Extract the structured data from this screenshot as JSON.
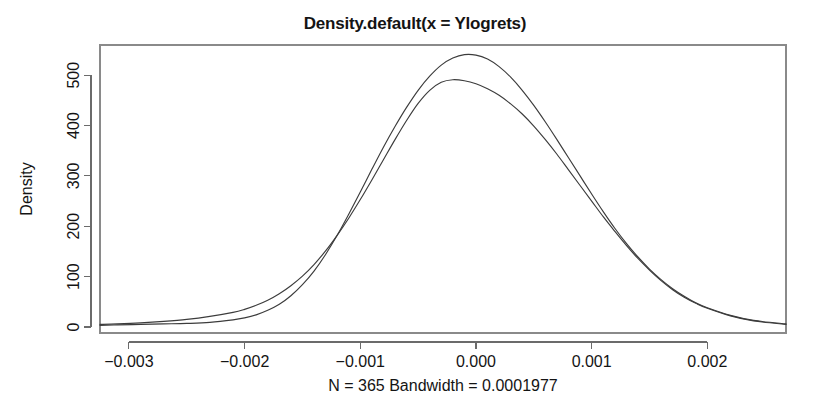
{
  "chart_data": {
    "type": "line",
    "title": "Density.default(x = Ylogrets)",
    "xlabel": "N = 365 Bandwidth = 0.0001977",
    "ylabel": "Density",
    "xlim": [
      -0.00325,
      0.00268
    ],
    "ylim": [
      -12,
      560
    ],
    "grid": false,
    "legend": "none",
    "xticks": [
      "-0.003",
      "-0.002",
      "-0.001",
      "0.000",
      "0.001",
      "0.002"
    ],
    "xtick_values": [
      -0.003,
      -0.002,
      -0.001,
      0.0,
      0.001,
      0.002
    ],
    "yticks": [
      "0",
      "100",
      "200",
      "300",
      "400",
      "500"
    ],
    "ytick_values": [
      0,
      100,
      200,
      300,
      400,
      500
    ],
    "series": [
      {
        "name": "kernel density estimate",
        "color": "#3c3c3c",
        "x": [
          -0.00325,
          -0.0031,
          -0.0029,
          -0.0027,
          -0.0025,
          -0.0023,
          -0.0021,
          -0.002,
          -0.0019,
          -0.0018,
          -0.0017,
          -0.0016,
          -0.0015,
          -0.0014,
          -0.0013,
          -0.0012,
          -0.0011,
          -0.001,
          -0.0009,
          -0.0008,
          -0.0007,
          -0.0006,
          -0.0005,
          -0.0004,
          -0.0003,
          -0.0002,
          -0.0001,
          0.0,
          0.0001,
          0.0002,
          0.0003,
          0.0004,
          0.0005,
          0.0006,
          0.0007,
          0.0008,
          0.0009,
          0.001,
          0.0011,
          0.0012,
          0.0013,
          0.0014,
          0.0015,
          0.0016,
          0.0017,
          0.0018,
          0.0019,
          0.002,
          0.0022,
          0.0024,
          0.00268
        ],
        "values": [
          3,
          4,
          5,
          6,
          7,
          9,
          14,
          18,
          24,
          33,
          45,
          62,
          84,
          111,
          144,
          182,
          224,
          268,
          313,
          357,
          398,
          436,
          470,
          498,
          520,
          534,
          541,
          540,
          532,
          517,
          496,
          470,
          440,
          407,
          372,
          336,
          300,
          264,
          229,
          196,
          166,
          139,
          115,
          94,
          76,
          61,
          48,
          38,
          23,
          13,
          6
        ]
      },
      {
        "name": "comparison normal density",
        "color": "#4a4a4a",
        "x": [
          -0.00325,
          -0.0031,
          -0.0029,
          -0.0027,
          -0.0025,
          -0.0023,
          -0.0021,
          -0.002,
          -0.0019,
          -0.0018,
          -0.0017,
          -0.0016,
          -0.0015,
          -0.0014,
          -0.0013,
          -0.0012,
          -0.0011,
          -0.001,
          -0.0009,
          -0.0008,
          -0.0007,
          -0.0006,
          -0.0005,
          -0.0004,
          -0.0003,
          -0.0002,
          -0.0001,
          0.0,
          0.0001,
          0.0002,
          0.0003,
          0.0004,
          0.0005,
          0.0006,
          0.0007,
          0.0008,
          0.0009,
          0.001,
          0.0011,
          0.0012,
          0.0013,
          0.0014,
          0.0015,
          0.0016,
          0.0017,
          0.0018,
          0.0019,
          0.002,
          0.0022,
          0.0024,
          0.00268
        ],
        "values": [
          5,
          6,
          8,
          11,
          15,
          21,
          29,
          35,
          43,
          53,
          66,
          82,
          101,
          124,
          151,
          182,
          216,
          253,
          292,
          332,
          372,
          410,
          444,
          470,
          486,
          491,
          489,
          483,
          473,
          460,
          443,
          423,
          399,
          372,
          343,
          312,
          281,
          250,
          219,
          190,
          162,
          136,
          113,
          92,
          74,
          59,
          47,
          37,
          22,
          12,
          5
        ]
      }
    ]
  },
  "layout": {
    "plot_left": 100,
    "plot_right": 786,
    "plot_top": 45,
    "plot_bottom": 333
  }
}
